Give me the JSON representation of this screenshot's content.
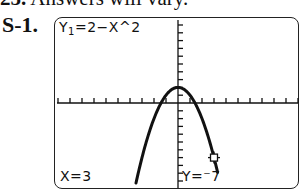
{
  "header": {
    "number": "25.",
    "text": "Answers will vary."
  },
  "exercise": {
    "label": "S-1."
  },
  "screen": {
    "equation_prefix": "Y",
    "equation_subscript": "1",
    "equation_body": "=2−X^2",
    "trace_x_label": "X=3",
    "trace_y_label": "Y=⁻7",
    "cursor_icon": "trace-cursor-square"
  },
  "colors": {
    "ink": "#111111",
    "frame": "#222222",
    "background": "#ffffff"
  },
  "chart_data": {
    "type": "line",
    "function": "y = 2 - x^2",
    "xlabel": "",
    "ylabel": "",
    "xlim": [
      -10,
      10
    ],
    "ylim": [
      -10,
      10
    ],
    "xscl": 1,
    "yscl": 1,
    "grid": false,
    "axes": true,
    "series": [
      {
        "name": "Y1",
        "x": [
          -3.5,
          -3,
          -2,
          -1,
          0,
          1,
          2,
          3,
          3.3
        ],
        "y": [
          -10.25,
          -7,
          -2,
          1,
          2,
          1,
          -2,
          -7,
          -8.89
        ]
      }
    ],
    "annotations": [
      {
        "type": "trace-cursor",
        "x": 3,
        "y": -7,
        "label_x": "X=3",
        "label_y": "Y=-7"
      }
    ]
  }
}
